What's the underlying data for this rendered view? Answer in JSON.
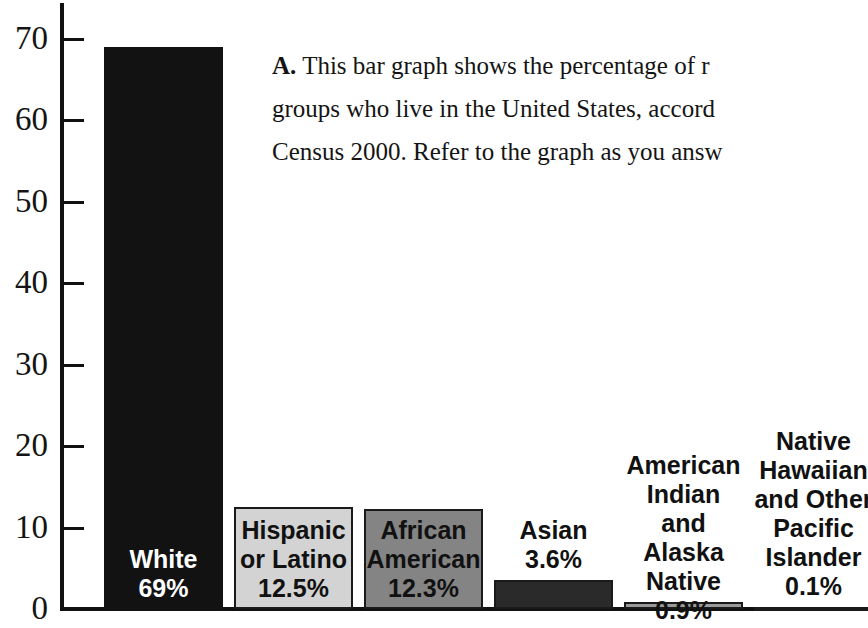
{
  "caption": {
    "label": "A.",
    "lines": [
      "This bar graph shows the percentage of r",
      "groups who live in the United States, accord",
      "Census 2000. Refer to the graph as you answ"
    ]
  },
  "chart_data": {
    "type": "bar",
    "title": "",
    "xlabel": "",
    "ylabel": "",
    "ylim": [
      0,
      72
    ],
    "grid": false,
    "legend": "none",
    "axis_tick_labels": [
      "70",
      "60",
      "50",
      "40",
      "30",
      "20",
      "10",
      "0"
    ],
    "axis_tick_values": [
      70,
      60,
      50,
      40,
      30,
      20,
      10,
      0
    ],
    "categories": [
      "White",
      "Hispanic or Latino",
      "African American",
      "Asian",
      "American Indian and Alaska Native",
      "Native Hawaiian and Other Pacific Islander"
    ],
    "values": [
      69,
      12.5,
      12.3,
      3.6,
      0.9,
      0.1
    ],
    "value_labels": [
      "69%",
      "12.5%",
      "12.3%",
      "3.6%",
      "0.9%",
      "0.1%"
    ],
    "bars": [
      {
        "category": "White",
        "label_lines": [
          "White",
          "69%"
        ],
        "value": 69,
        "value_label": "69%",
        "fill": "#121212",
        "text_color": "#ffffff",
        "label_position": "inside"
      },
      {
        "category": "Hispanic or Latino",
        "label_lines": [
          "Hispanic",
          "or Latino",
          "12.5%"
        ],
        "value": 12.5,
        "value_label": "12.5%",
        "fill": "#d3d3d3",
        "text_color": "#111111",
        "label_position": "inside"
      },
      {
        "category": "African American",
        "label_lines": [
          "African",
          "American",
          "12.3%"
        ],
        "value": 12.3,
        "value_label": "12.3%",
        "fill": "#848484",
        "text_color": "#111111",
        "label_position": "inside"
      },
      {
        "category": "Asian",
        "label_lines": [
          "Asian",
          "3.6%"
        ],
        "value": 3.6,
        "value_label": "3.6%",
        "fill": "#2a2a2a",
        "text_color": "#111111",
        "label_position": "above"
      },
      {
        "category": "American Indian and Alaska Native",
        "label_lines": [
          "American",
          "Indian and",
          "Alaska",
          "Native",
          "0.9%"
        ],
        "value": 0.9,
        "value_label": "0.9%",
        "fill": "#9a9a9a",
        "text_color": "#111111",
        "label_position": "above"
      },
      {
        "category": "Native Hawaiian and Other Pacific Islander",
        "label_lines": [
          "Native",
          "Hawaiian",
          "and Other",
          "Pacific",
          "Islander",
          "0.1%"
        ],
        "value": 0.1,
        "value_label": "0.1%",
        "fill": "#4a4a4a",
        "text_color": "#111111",
        "label_position": "above"
      }
    ]
  },
  "colors": {
    "axis": "#111111",
    "background": "#ffffff",
    "text": "#141414"
  }
}
